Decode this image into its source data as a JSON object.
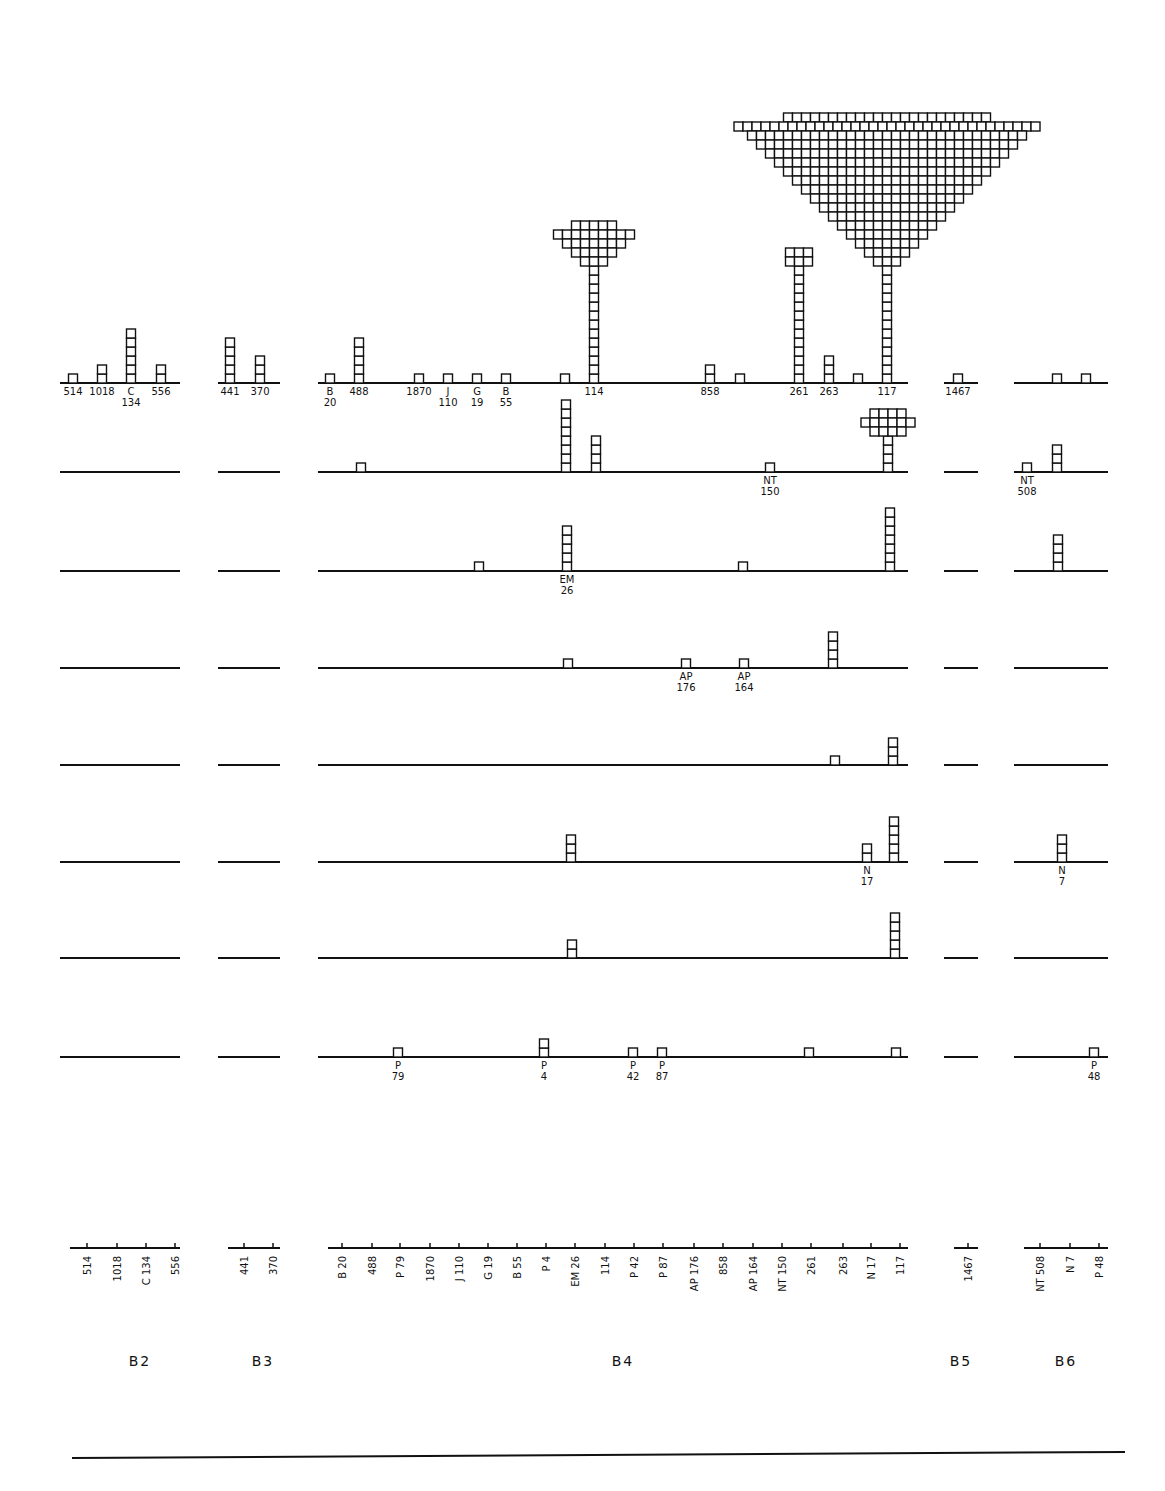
{
  "chart_data": {
    "type": "histogram-stacked-squares",
    "title": "",
    "cell_size": 9,
    "groups": [
      {
        "name": "B2",
        "x0": 60,
        "x1": 180,
        "label_x": 140
      },
      {
        "name": "B3",
        "x0": 218,
        "x1": 280,
        "label_x": 263
      },
      {
        "name": "B4",
        "x0": 318,
        "x1": 908,
        "label_x": 623
      },
      {
        "name": "B5",
        "x0": 944,
        "x1": 978,
        "label_x": 961
      },
      {
        "name": "B6",
        "x0": 1014,
        "x1": 1108,
        "label_x": 1066
      }
    ],
    "bottom_axis": {
      "categories_by_group": {
        "B2": [
          [
            "514",
            87
          ],
          [
            "1018",
            117
          ],
          [
            "C 134",
            146
          ],
          [
            "556",
            175
          ]
        ],
        "B3": [
          [
            "441",
            244
          ],
          [
            "370",
            273
          ]
        ],
        "B4": [
          [
            "B 20",
            342
          ],
          [
            "488",
            372
          ],
          [
            "P 79",
            400
          ],
          [
            "1870",
            430
          ],
          [
            "J 110",
            459
          ],
          [
            "G 19",
            488
          ],
          [
            "B 55",
            517
          ],
          [
            "P 4",
            546
          ],
          [
            "EM 26",
            575
          ],
          [
            "114",
            605
          ],
          [
            "P 42",
            634
          ],
          [
            "P 87",
            663
          ],
          [
            "AP 176",
            694
          ],
          [
            "858",
            723
          ],
          [
            "AP 164",
            753
          ],
          [
            "NT 150",
            782
          ],
          [
            "261",
            811
          ],
          [
            "263",
            843
          ],
          [
            "N 17",
            871
          ],
          [
            "117",
            900
          ]
        ],
        "B5": [
          [
            "1467",
            968
          ]
        ],
        "B6": [
          [
            "NT 508",
            1040
          ],
          [
            "N 7",
            1070
          ],
          [
            "P 48",
            1099
          ]
        ]
      },
      "axis_y": 1248
    },
    "rows": [
      {
        "row": 1,
        "baseline_y": 383,
        "bars": [
          {
            "x": 73,
            "n": 1,
            "label": [
              "514"
            ]
          },
          {
            "x": 102,
            "n": 2,
            "label": [
              "1018"
            ]
          },
          {
            "x": 131,
            "n": 6,
            "label": [
              "C",
              "134"
            ]
          },
          {
            "x": 161,
            "n": 2,
            "label": [
              "556"
            ]
          },
          {
            "x": 230,
            "n": 5,
            "label": [
              "441"
            ]
          },
          {
            "x": 260,
            "n": 3,
            "label": [
              "370"
            ]
          },
          {
            "x": 330,
            "n": 1,
            "label": [
              "B",
              "20"
            ]
          },
          {
            "x": 359,
            "n": 5,
            "label": [
              "488"
            ]
          },
          {
            "x": 419,
            "n": 1,
            "label": [
              "1870"
            ]
          },
          {
            "x": 448,
            "n": 1,
            "label": [
              "J",
              "110"
            ]
          },
          {
            "x": 477,
            "n": 1,
            "label": [
              "G",
              "19"
            ]
          },
          {
            "x": 506,
            "n": 1,
            "label": [
              "B",
              "55"
            ]
          },
          {
            "x": 565,
            "n": 1,
            "label": []
          },
          {
            "x": 594,
            "n": 19,
            "label": [
              "114"
            ],
            "cap": "mushroom-small"
          },
          {
            "x": 710,
            "n": 2,
            "label": [
              "858"
            ]
          },
          {
            "x": 740,
            "n": 1,
            "label": []
          },
          {
            "x": 799,
            "n": 15,
            "label": [
              "261"
            ],
            "cap": "3x2"
          },
          {
            "x": 829,
            "n": 3,
            "label": [
              "263"
            ]
          },
          {
            "x": 858,
            "n": 1,
            "label": []
          },
          {
            "x": 887,
            "n": 260,
            "label": [
              "117"
            ],
            "cap": "inverted-triangle-large"
          },
          {
            "x": 958,
            "n": 1,
            "label": [
              "1467"
            ]
          },
          {
            "x": 1057,
            "n": 1,
            "label": []
          },
          {
            "x": 1086,
            "n": 1,
            "label": []
          }
        ]
      },
      {
        "row": 2,
        "baseline_y": 472,
        "bars": [
          {
            "x": 361,
            "n": 1,
            "label": []
          },
          {
            "x": 566,
            "n": 8,
            "label": []
          },
          {
            "x": 596,
            "n": 4,
            "label": []
          },
          {
            "x": 770,
            "n": 1,
            "label": [
              "NT",
              "150"
            ]
          },
          {
            "x": 888,
            "n": 25,
            "label": [],
            "cap": "mushroom-medium"
          },
          {
            "x": 1027,
            "n": 1,
            "label": [
              "NT",
              "508"
            ]
          },
          {
            "x": 1057,
            "n": 3,
            "label": []
          }
        ]
      },
      {
        "row": 3,
        "baseline_y": 571,
        "bars": [
          {
            "x": 479,
            "n": 1,
            "label": []
          },
          {
            "x": 567,
            "n": 5,
            "label": [
              "EM",
              "26"
            ]
          },
          {
            "x": 743,
            "n": 1,
            "label": []
          },
          {
            "x": 890,
            "n": 7,
            "label": []
          },
          {
            "x": 1058,
            "n": 4,
            "label": []
          }
        ]
      },
      {
        "row": 4,
        "baseline_y": 668,
        "bars": [
          {
            "x": 568,
            "n": 1,
            "label": []
          },
          {
            "x": 686,
            "n": 1,
            "label": [
              "AP",
              "176"
            ]
          },
          {
            "x": 744,
            "n": 1,
            "label": [
              "AP",
              "164"
            ]
          },
          {
            "x": 833,
            "n": 4,
            "label": []
          }
        ]
      },
      {
        "row": 5,
        "baseline_y": 765,
        "bars": [
          {
            "x": 835,
            "n": 1,
            "label": []
          },
          {
            "x": 893,
            "n": 3,
            "label": []
          }
        ]
      },
      {
        "row": 6,
        "baseline_y": 862,
        "bars": [
          {
            "x": 571,
            "n": 3,
            "label": []
          },
          {
            "x": 867,
            "n": 2,
            "label": [
              "N",
              "17"
            ]
          },
          {
            "x": 894,
            "n": 5,
            "label": []
          },
          {
            "x": 1062,
            "n": 3,
            "label": [
              "N",
              "7"
            ]
          }
        ]
      },
      {
        "row": 7,
        "baseline_y": 958,
        "bars": [
          {
            "x": 572,
            "n": 2,
            "label": []
          },
          {
            "x": 895,
            "n": 5,
            "label": []
          }
        ]
      },
      {
        "row": 8,
        "baseline_y": 1057,
        "bars": [
          {
            "x": 398,
            "n": 1,
            "label": [
              "P",
              "79"
            ]
          },
          {
            "x": 544,
            "n": 2,
            "label": [
              "P",
              "4"
            ]
          },
          {
            "x": 633,
            "n": 1,
            "label": [
              "P",
              "42"
            ]
          },
          {
            "x": 662,
            "n": 1,
            "label": [
              "P",
              "87"
            ]
          },
          {
            "x": 809,
            "n": 1,
            "label": []
          },
          {
            "x": 896,
            "n": 1,
            "label": []
          },
          {
            "x": 1094,
            "n": 1,
            "label": [
              "P",
              "48"
            ]
          }
        ]
      }
    ],
    "group_labels": [
      "B2",
      "B3",
      "B4",
      "B5",
      "B6"
    ],
    "group_label_y": 1366,
    "footer_line_y": 1455,
    "grid": false,
    "legend": null,
    "xlabel": "",
    "ylabel": ""
  }
}
